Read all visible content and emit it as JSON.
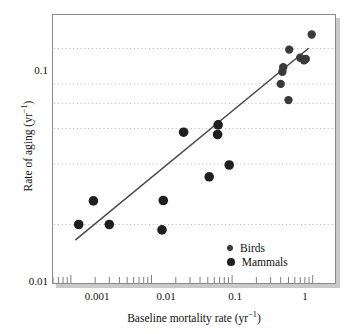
{
  "chart_data": {
    "type": "scatter",
    "title": "",
    "xlabel": "Baseline mortality rate (yr−1)",
    "ylabel": "Rate of aging (yr−1)",
    "xscale": "log",
    "yscale": "log",
    "xlim": [
      0.0006,
      2.0
    ],
    "ylim": [
      0.01,
      0.22
    ],
    "xticks": [
      0.001,
      0.01,
      0.1,
      1
    ],
    "xticklabels": [
      "0.001",
      "0.01",
      "0.1",
      "1"
    ],
    "yticks": [
      0.01,
      0.1
    ],
    "yticklabels": [
      "0.01",
      "0.1"
    ],
    "grid": "horizontal-dotted",
    "gridlines_y": [
      0.02,
      0.04,
      0.06,
      0.08,
      0.1,
      0.15
    ],
    "legend_position": "bottom-right",
    "series": [
      {
        "name": "Birds",
        "marker": "circle",
        "marker_size": 4.2,
        "color": "#3a3a3a",
        "points": [
          {
            "x": 0.4,
            "y": 0.1
          },
          {
            "x": 0.42,
            "y": 0.115
          },
          {
            "x": 0.43,
            "y": 0.121
          },
          {
            "x": 0.5,
            "y": 0.083
          },
          {
            "x": 0.51,
            "y": 0.148
          },
          {
            "x": 0.7,
            "y": 0.135
          },
          {
            "x": 0.78,
            "y": 0.131
          },
          {
            "x": 0.82,
            "y": 0.133
          },
          {
            "x": 0.97,
            "y": 0.176
          }
        ]
      },
      {
        "name": "Mammals",
        "marker": "circle",
        "marker_size": 4.8,
        "color": "#1f1f1f",
        "points": [
          {
            "x": 0.00125,
            "y": 0.02
          },
          {
            "x": 0.0019,
            "y": 0.0262
          },
          {
            "x": 0.003,
            "y": 0.02
          },
          {
            "x": 0.0135,
            "y": 0.0188
          },
          {
            "x": 0.014,
            "y": 0.0263
          },
          {
            "x": 0.025,
            "y": 0.0575
          },
          {
            "x": 0.052,
            "y": 0.0345
          },
          {
            "x": 0.066,
            "y": 0.056
          },
          {
            "x": 0.067,
            "y": 0.0625
          },
          {
            "x": 0.092,
            "y": 0.0395
          }
        ]
      }
    ],
    "trendline": {
      "name": "fitted-regression-line",
      "color": "#4a4a4a",
      "x_start": 0.00115,
      "y_start": 0.0168,
      "x_end": 0.88,
      "y_end": 0.15
    }
  },
  "axes": {
    "y_tick_top": "0.1",
    "y_tick_bottom": "0.01",
    "x_tick_1": "0.001",
    "x_tick_2": "0.01",
    "x_tick_3": "0.1",
    "x_tick_4": "1",
    "x_title_main": "Baseline mortality rate (yr",
    "x_title_sup": "−1",
    "x_title_end": ")",
    "y_title_main": "Rate of aging (yr",
    "y_title_sup": "−1",
    "y_title_end": ")"
  },
  "legend": {
    "items": [
      {
        "label": "Birds"
      },
      {
        "label": "Mammals"
      }
    ]
  }
}
